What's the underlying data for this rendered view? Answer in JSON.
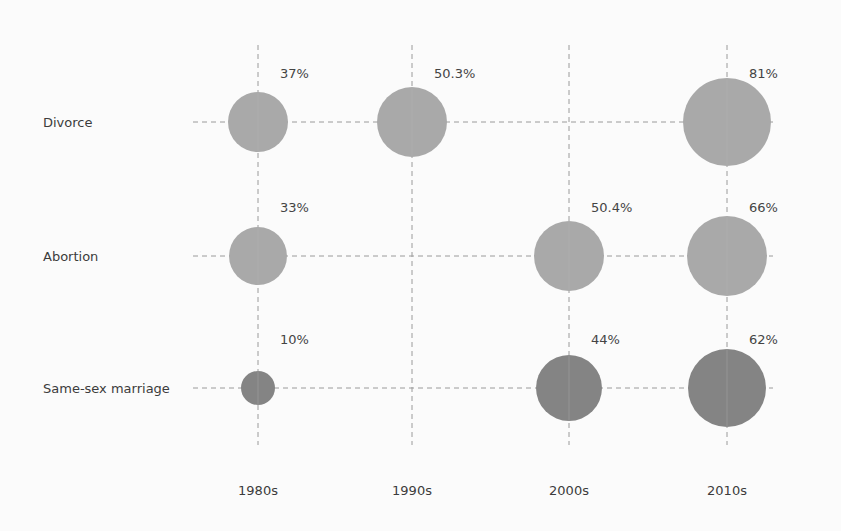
{
  "chart_data": {
    "type": "bubble-grid",
    "title": "",
    "xlabel": "",
    "ylabel": "",
    "grid": true,
    "grid_style": "dashed",
    "categories": [
      "1980s",
      "1990s",
      "2000s",
      "2010s"
    ],
    "rows": [
      "Divorce",
      "Abortion",
      "Same-sex marriage"
    ],
    "series": [
      {
        "name": "Divorce",
        "color": "#a9a9a9",
        "points": [
          {
            "x": "1980s",
            "value": 37,
            "label": "37%"
          },
          {
            "x": "1990s",
            "value": 50.3,
            "label": "50.3%"
          },
          {
            "x": "2010s",
            "value": 81,
            "label": "81%"
          }
        ]
      },
      {
        "name": "Abortion",
        "color": "#a9a9a9",
        "points": [
          {
            "x": "1980s",
            "value": 33,
            "label": "33%"
          },
          {
            "x": "2000s",
            "value": 50.4,
            "label": "50.4%"
          },
          {
            "x": "2010s",
            "value": 66,
            "label": "66%"
          }
        ]
      },
      {
        "name": "Same-sex marriage",
        "color": "#848484",
        "points": [
          {
            "x": "1980s",
            "value": 10,
            "label": "10%"
          },
          {
            "x": "2000s",
            "value": 44,
            "label": "44%"
          },
          {
            "x": "2010s",
            "value": 62,
            "label": "62%"
          }
        ]
      }
    ]
  },
  "layout": {
    "col_x": {
      "1980s": 258,
      "1990s": 412,
      "2000s": 569,
      "2010s": 727
    },
    "row_y": {
      "Divorce": 122,
      "Abortion": 256,
      "Same-sex marriage": 388
    },
    "radius": {
      "Divorce": {
        "1980s": 30,
        "1990s": 35,
        "2010s": 44
      },
      "Abortion": {
        "1980s": 29,
        "2000s": 35,
        "2010s": 40
      },
      "Same-sex marriage": {
        "1980s": 17,
        "2000s": 33,
        "2010s": 39
      }
    },
    "grid_color": "#9a9a9a"
  }
}
